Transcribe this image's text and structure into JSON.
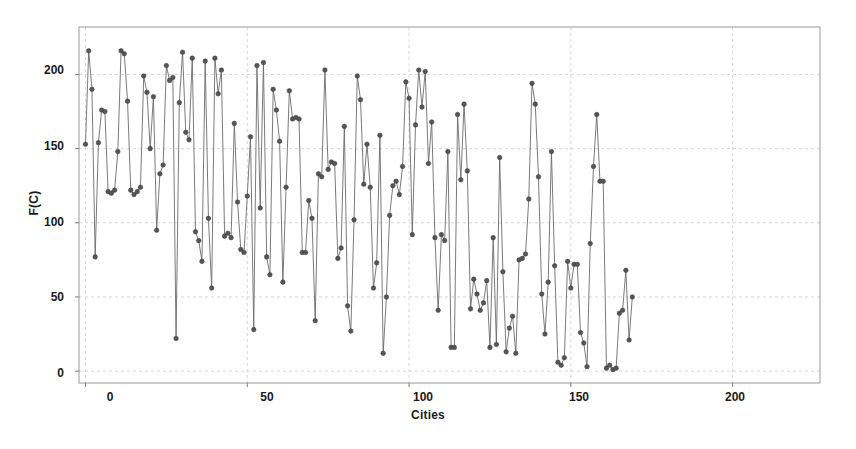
{
  "chart_data": {
    "type": "line",
    "title": "",
    "subtitle": "",
    "xlabel": "Cities",
    "ylabel": "F(C)",
    "xlim": [
      -2,
      227
    ],
    "ylim": [
      -8,
      232
    ],
    "xticks": [
      0,
      50,
      100,
      150,
      200
    ],
    "yticks": [
      0,
      50,
      100,
      150,
      200
    ],
    "grid": true,
    "legend": null,
    "marker": "circle",
    "marker_color": "#555555",
    "line_color": "#6b6b6b",
    "frame_color": "#9a9a9a",
    "grid_color": "#cccccc",
    "series": [
      {
        "name": "F(C)",
        "x_start": 0,
        "x_step": 1,
        "values": [
          153,
          216,
          190,
          77,
          154,
          176,
          175,
          121,
          120,
          122,
          148,
          216,
          214,
          182,
          122,
          119,
          121,
          124,
          199,
          188,
          150,
          185,
          95,
          133,
          139,
          206,
          196,
          198,
          22,
          181,
          215,
          161,
          156,
          211,
          94,
          88,
          74,
          209,
          103,
          56,
          211,
          187,
          203,
          91,
          93,
          90,
          167,
          114,
          82,
          80,
          118,
          158,
          28,
          206,
          110,
          208,
          77,
          65,
          190,
          176,
          155,
          60,
          124,
          189,
          170,
          171,
          170,
          80,
          80,
          115,
          103,
          34,
          133,
          131,
          203,
          136,
          141,
          140,
          76,
          83,
          165,
          44,
          27,
          102,
          199,
          183,
          126,
          153,
          124,
          56,
          73,
          159,
          12,
          50,
          105,
          125,
          128,
          119,
          138,
          195,
          184,
          92,
          166,
          203,
          178,
          202,
          140,
          168,
          90,
          41,
          92,
          88,
          148,
          16,
          16,
          173,
          129,
          180,
          135,
          42,
          62,
          52,
          41,
          46,
          61,
          16,
          90,
          18,
          144,
          67,
          13,
          29,
          37,
          12,
          75,
          76,
          79,
          116,
          194,
          180,
          131,
          52,
          25,
          60,
          148,
          71,
          6,
          4,
          9,
          74,
          56,
          72,
          72,
          26,
          19,
          3,
          86,
          138,
          173,
          128,
          128,
          2,
          4,
          1,
          2,
          39,
          41,
          68,
          21,
          50
        ]
      }
    ]
  },
  "axes": {
    "y_tick_labels": [
      "200",
      "150",
      "100",
      "50",
      "0"
    ],
    "x_tick_labels": [
      "0",
      "50",
      "100",
      "150",
      "200"
    ]
  },
  "background_artifacts": [
    "F(C)",
    "Cities"
  ]
}
